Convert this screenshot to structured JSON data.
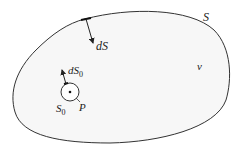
{
  "diagram": {
    "colors": {
      "stroke": "#333333",
      "fill": "#f7f7f7",
      "text": "#222222"
    },
    "labels": {
      "surface": "S",
      "volume": "v",
      "surface_element": "dS",
      "inner_surface": "S",
      "inner_surface_sub": "0",
      "inner_element": "dS",
      "inner_element_sub": "0",
      "point": "P"
    }
  }
}
